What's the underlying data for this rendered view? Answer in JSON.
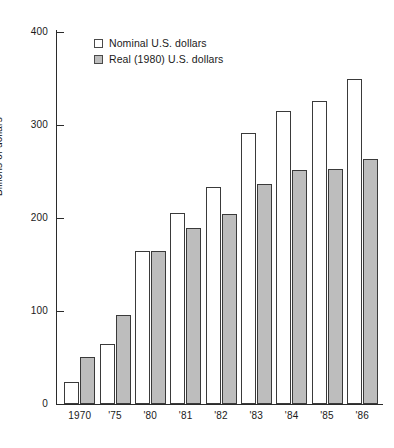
{
  "chart_data": {
    "type": "bar",
    "title": "",
    "xlabel": "",
    "ylabel": "Billions of dollars",
    "ylim": [
      0,
      400
    ],
    "yticks": [
      0,
      100,
      200,
      300,
      400
    ],
    "ytick_labels": [
      "0",
      "100",
      "200",
      "300",
      "400"
    ],
    "grid": false,
    "legend_position": "top-left-inside",
    "categories": [
      "1970",
      "'75",
      "'80",
      "'81",
      "'82",
      "'83",
      "'84",
      "'85",
      "'86"
    ],
    "series": [
      {
        "name": "Nominal U.S. dollars",
        "color": "#ffffff",
        "values": [
          24,
          65,
          165,
          205,
          233,
          291,
          315,
          326,
          350
        ]
      },
      {
        "name": "Real (1980) U.S. dollars",
        "color": "#bdbdbd",
        "values": [
          51,
          96,
          165,
          189,
          204,
          237,
          252,
          253,
          263
        ]
      }
    ]
  },
  "legend": {
    "items": [
      {
        "label": "Nominal U.S. dollars",
        "swatch": "open-square-swatch"
      },
      {
        "label": "Real (1980) U.S. dollars",
        "swatch": "filled-square-swatch"
      }
    ]
  },
  "axes": {
    "y_title": "Billions of dollars",
    "y_labels": [
      "400",
      "300",
      "200",
      "100",
      "0"
    ],
    "x_labels": [
      "1970",
      "'75",
      "'80",
      "'81",
      "'82",
      "'83",
      "'84",
      "'85",
      "'86"
    ]
  }
}
